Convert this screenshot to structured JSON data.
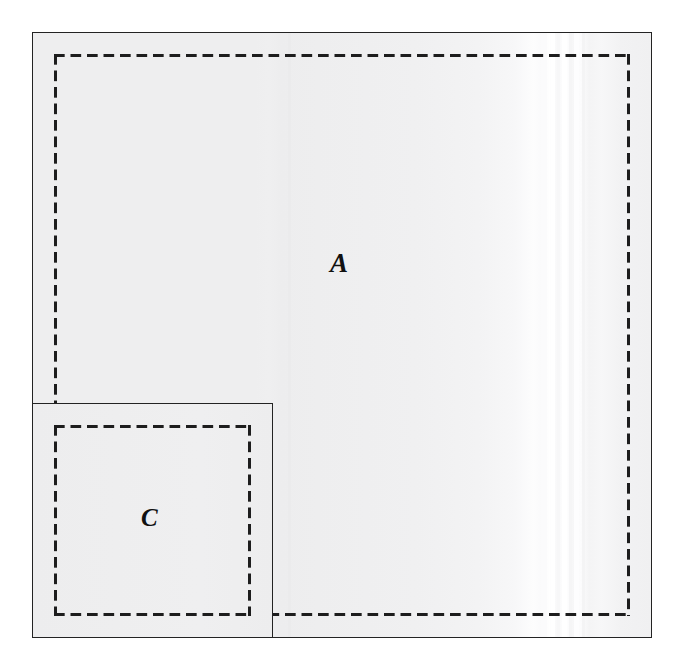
{
  "figure": {
    "canvas": {
      "width": 687,
      "height": 670,
      "background_color": "#ffffff"
    },
    "regions": [
      {
        "id": "A",
        "label": "A",
        "role": "main-region",
        "outline_style": "solid",
        "outline_color": "#232323",
        "fill_color": "#eeeeef",
        "boundary_style": "dashed",
        "boundary_color": "#1d1d1d",
        "bounds": {
          "x": 32,
          "y": 32,
          "width": 620,
          "height": 606
        },
        "dashed_bounds": {
          "x": 55,
          "y": 55,
          "width": 578,
          "height": 561
        }
      },
      {
        "id": "C",
        "label": "C",
        "role": "inset-region",
        "outline_style": "solid",
        "outline_color": "#232323",
        "fill_color": "#eeeeef",
        "boundary_style": "dashed",
        "boundary_color": "#1d1d1d",
        "bounds": {
          "x": 32,
          "y": 403,
          "width": 241,
          "height": 235
        },
        "dashed_bounds": {
          "x": 55,
          "y": 426,
          "width": 194,
          "height": 189
        }
      }
    ],
    "shading": {
      "description": "near-white vertical bands on the right portion of region A",
      "band_color_light": "#ffffff",
      "band_color_base": "#eeeeef",
      "bands": [
        {
          "x": 542,
          "width": 6,
          "color": "#fcfcfd"
        },
        {
          "x": 551,
          "width": 4,
          "color": "#ffffff"
        },
        {
          "x": 557,
          "width": 3,
          "color": "#f8f8f9"
        },
        {
          "x": 562,
          "width": 5,
          "color": "#ffffff"
        },
        {
          "x": 569,
          "width": 3,
          "color": "#f6f6f7"
        },
        {
          "x": 574,
          "width": 5,
          "color": "#fdfdfe"
        },
        {
          "x": 582,
          "width": 3,
          "color": "#f5f5f6"
        },
        {
          "x": 288,
          "width": 3,
          "color": "#ececed"
        }
      ]
    },
    "dash_pattern": {
      "dash_length_px": 11,
      "gap_length_px": 5.5,
      "stroke_width_px": 2.6
    }
  }
}
